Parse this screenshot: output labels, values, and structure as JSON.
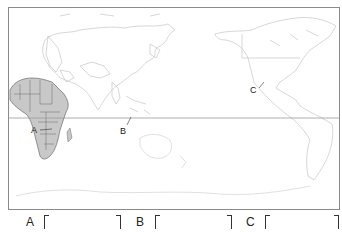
{
  "map": {
    "projection": "Pacific-centered world map",
    "highlighted_region": "Africa",
    "highlight_color": "#c8c8c8",
    "frame_color": "#8a8a8a",
    "equator_color": "#9a9a9a",
    "labels": [
      {
        "id": "A",
        "text": "A"
      },
      {
        "id": "B",
        "text": "B"
      },
      {
        "id": "C",
        "text": "C"
      }
    ]
  },
  "answers": [
    {
      "letter": "A",
      "value": ""
    },
    {
      "letter": "B",
      "value": ""
    },
    {
      "letter": "C",
      "value": ""
    }
  ]
}
